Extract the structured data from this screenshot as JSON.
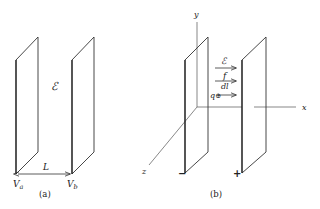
{
  "panel_a": {
    "caption": "(a)",
    "field_label": "ℰ",
    "distance_label": "L",
    "left_plate_label": "V",
    "left_plate_sub": "a",
    "right_plate_label": "V",
    "right_plate_sub": "b"
  },
  "panel_b": {
    "caption": "(b)",
    "axis_x": "x",
    "axis_y": "y",
    "axis_z": "z",
    "field_label": "ℰ",
    "force_label": "f",
    "displacement_label": "dl",
    "charge_label": "q",
    "charge_symbol": "⊕",
    "negative_sign": "−",
    "positive_sign": "+"
  }
}
